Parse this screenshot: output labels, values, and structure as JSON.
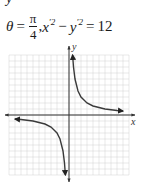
{
  "header": {
    "cut_text": "y",
    "theta_symbol": "θ",
    "equals": "=",
    "pi_numerator": "π",
    "denominator": "4",
    "comma": ",",
    "x_var": "x",
    "y_var": "y",
    "prime_sq": "′2",
    "minus": "−",
    "rhs": "12",
    "equation_text": "θ = π/4, x′² − y′² = 12"
  },
  "graph": {
    "x_axis_label": "x",
    "y_axis_label": "y",
    "grid": {
      "cols": 20,
      "rows": 20,
      "color": "#d0d0d0"
    },
    "curve_color": "#3a3a3a",
    "description": "Rectangular hyperbola xy = 6 (rotated x'^2 - y'^2 = 12), branches in quadrants I and III"
  },
  "chart_data": {
    "type": "line",
    "xlabel": "x",
    "ylabel": "y",
    "xlim": [
      -10,
      10
    ],
    "ylim": [
      -10,
      10
    ],
    "grid": true,
    "series": [
      {
        "name": "branch-quadrant-I",
        "equation": "xy = 6, x > 0",
        "points": [
          [
            0.6,
            10
          ],
          [
            0.75,
            8
          ],
          [
            1,
            6
          ],
          [
            1.5,
            4
          ],
          [
            2,
            3
          ],
          [
            3,
            2
          ],
          [
            4,
            1.5
          ],
          [
            6,
            1
          ],
          [
            8,
            0.75
          ],
          [
            9,
            0.67
          ]
        ]
      },
      {
        "name": "branch-quadrant-III",
        "equation": "xy = 6, x < 0",
        "points": [
          [
            -9,
            -0.67
          ],
          [
            -8,
            -0.75
          ],
          [
            -6,
            -1
          ],
          [
            -4,
            -1.5
          ],
          [
            -3,
            -2
          ],
          [
            -2,
            -3
          ],
          [
            -1.5,
            -4
          ],
          [
            -1,
            -6
          ],
          [
            -0.75,
            -8
          ],
          [
            -0.6,
            -10
          ]
        ]
      }
    ]
  }
}
